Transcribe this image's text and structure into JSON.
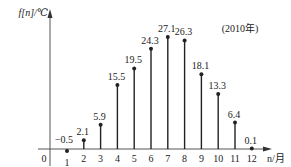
{
  "chart_data": {
    "type": "stem",
    "title": "",
    "annotation": "(2010年)",
    "xlabel": "n/月",
    "ylabel": "f[n]/℃",
    "origin_label": "0",
    "categories": [
      "1",
      "2",
      "3",
      "4",
      "5",
      "6",
      "7",
      "8",
      "9",
      "10",
      "11",
      "12"
    ],
    "x": [
      1,
      2,
      3,
      4,
      5,
      6,
      7,
      8,
      9,
      10,
      11,
      12
    ],
    "values": [
      -0.5,
      2.1,
      5.9,
      15.5,
      19.5,
      24.3,
      27.1,
      26.3,
      18.1,
      13.3,
      6.4,
      0.1
    ],
    "value_labels": [
      "−0.5",
      "2.1",
      "5.9",
      "15.5",
      "19.5",
      "24.3",
      "27.1",
      "26.3",
      "18.1",
      "13.3",
      "6.4",
      "0.1"
    ],
    "grid": false,
    "legend": "none",
    "colors": {
      "stem": "#222222",
      "axis": "#555555",
      "background": "#ffffff"
    }
  }
}
